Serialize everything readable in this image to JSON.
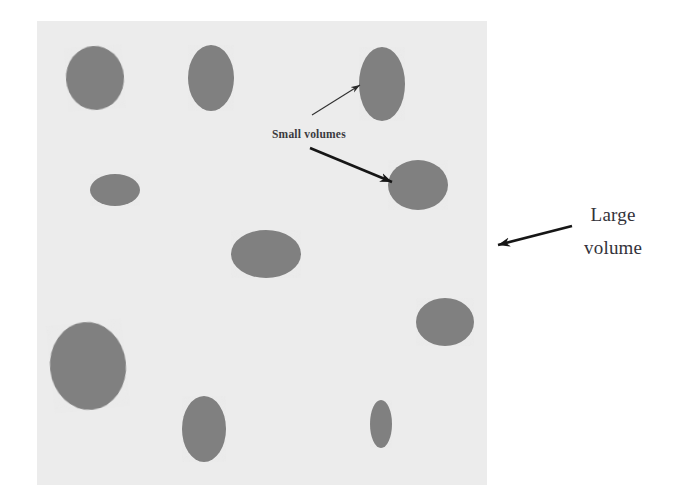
{
  "figure": {
    "type": "schematic-diagram",
    "canvas": {
      "width": 675,
      "height": 503,
      "background": "#ffffff"
    },
    "large_volume_box": {
      "name": "large-volume-field",
      "x": 37,
      "y": 21,
      "width": 450,
      "height": 464,
      "fill": "#ececec"
    },
    "colors": {
      "background": "#ffffff",
      "field_fill": "#ececec",
      "inclusion_fill": "#808080",
      "arrow": "#1a1a1a",
      "text": "#33323a"
    },
    "labels": {
      "small_volumes": "Small volumes",
      "large_volume_line1": "Large",
      "large_volume_line2": "volume"
    },
    "inclusions": [
      {
        "name": "small-volume-1",
        "cx": 95,
        "cy": 78,
        "rx": 29,
        "ry": 32,
        "rot": -4
      },
      {
        "name": "small-volume-2",
        "cx": 211,
        "cy": 78,
        "rx": 23,
        "ry": 33,
        "rot": 0
      },
      {
        "name": "small-volume-3",
        "cx": 382,
        "cy": 84,
        "rx": 23,
        "ry": 37,
        "rot": 0
      },
      {
        "name": "small-volume-4",
        "cx": 115,
        "cy": 190,
        "rx": 25,
        "ry": 16,
        "rot": 0
      },
      {
        "name": "small-volume-5",
        "cx": 418,
        "cy": 185,
        "rx": 30,
        "ry": 25,
        "rot": 0
      },
      {
        "name": "small-volume-6",
        "cx": 266,
        "cy": 254,
        "rx": 35,
        "ry": 24,
        "rot": 0
      },
      {
        "name": "small-volume-7",
        "cx": 445,
        "cy": 322,
        "rx": 29,
        "ry": 24,
        "rot": 0
      },
      {
        "name": "small-volume-8",
        "cx": 88,
        "cy": 366,
        "rx": 38,
        "ry": 44,
        "rot": -6
      },
      {
        "name": "small-volume-9",
        "cx": 204,
        "cy": 429,
        "rx": 22,
        "ry": 33,
        "rot": 0
      },
      {
        "name": "small-volume-10",
        "cx": 381,
        "cy": 424,
        "rx": 11,
        "ry": 24,
        "rot": 0
      }
    ],
    "annotations": [
      {
        "name": "thin-leader-arrow",
        "style": "thin-line",
        "from_x": 312,
        "from_y": 115,
        "to_x": 360,
        "to_y": 85,
        "points_to": "small-volume-3"
      },
      {
        "name": "small-volumes-arrow",
        "style": "thick-barbed",
        "from_x": 310,
        "from_y": 148,
        "to_x": 392,
        "to_y": 182,
        "points_to": "small-volume-5"
      },
      {
        "name": "large-volume-arrow",
        "style": "thick-barbed",
        "from_x": 572,
        "from_y": 226,
        "to_x": 498,
        "to_y": 245,
        "points_to": "large-volume-field"
      }
    ]
  }
}
